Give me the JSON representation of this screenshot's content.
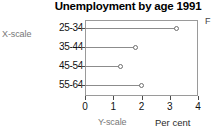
{
  "chart_data": {
    "type": "bar",
    "subtype": "lollipop-dot-plot-horizontal",
    "title": "Unemployment by age 1991",
    "xlabel": "Per cent",
    "ylabel": "",
    "categories": [
      "25-34",
      "35-44",
      "45-54",
      "55-64"
    ],
    "values": [
      3.25,
      1.8,
      1.25,
      2.0
    ],
    "xlim": [
      0,
      4
    ],
    "xticks": [
      0,
      1,
      2,
      3,
      4
    ],
    "xticklabels": [
      "0",
      "1",
      "2",
      "3",
      "4"
    ],
    "grid": false,
    "legend": false,
    "orientation": "horizontal",
    "marker_style": "open-circle"
  },
  "annotations": {
    "x_scale_callout": "X-scale",
    "y_scale_callout": "Y-scale",
    "corner_letter": "F"
  },
  "axis": {
    "x_axis_title": "Per cent"
  }
}
